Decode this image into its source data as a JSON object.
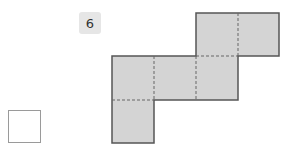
{
  "problem": {
    "number": "6"
  },
  "net": {
    "fill": "#d4d4d4",
    "stroke": "#555555",
    "fold_stroke": "#666666",
    "cell_size": 42,
    "cells": [
      {
        "col": 2,
        "row": 0
      },
      {
        "col": 3,
        "row": 0
      },
      {
        "col": 0,
        "row": 1
      },
      {
        "col": 1,
        "row": 1
      },
      {
        "col": 2,
        "row": 1
      },
      {
        "col": 0,
        "row": 2
      }
    ]
  },
  "answer_box": {
    "value": ""
  }
}
